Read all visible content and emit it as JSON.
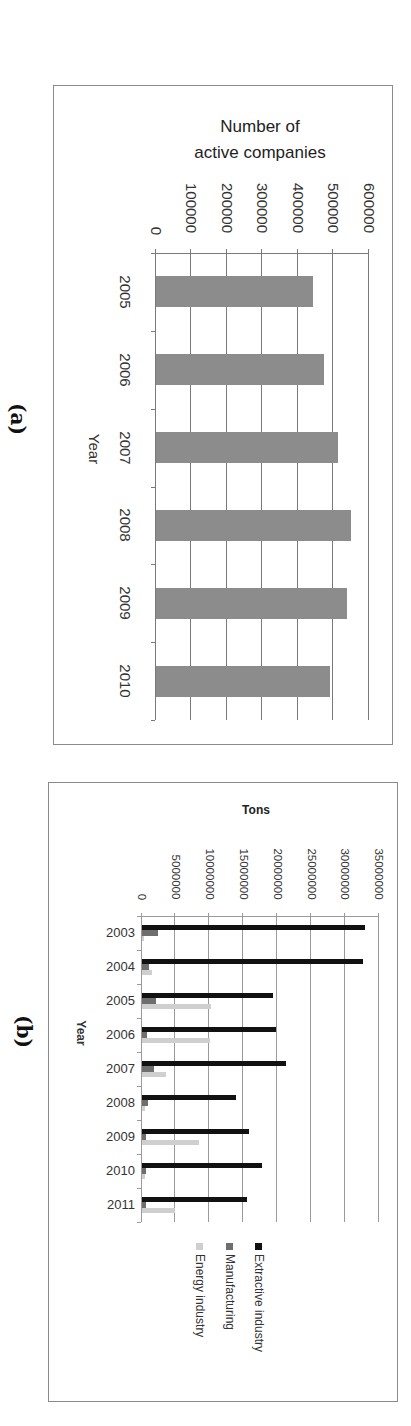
{
  "figure": {
    "panel_a_label": "(a)",
    "panel_b_label": "(b)"
  },
  "chart_data": [
    {
      "type": "bar",
      "orientation": "horizontal (figure rotated 90° clockwise)",
      "title": "Number of active companies",
      "title_lines": [
        "Number of",
        "active companies"
      ],
      "xlabel": "Year",
      "ylabel": "Number of active companies",
      "categories": [
        "2005",
        "2006",
        "2007",
        "2008",
        "2009",
        "2010"
      ],
      "values": [
        443000,
        473000,
        514000,
        550000,
        538000,
        491000
      ],
      "value_ticks": [
        "0",
        "100000",
        "200000",
        "300000",
        "400000",
        "500000",
        "600000"
      ],
      "ylim": [
        0,
        600000
      ],
      "grid": true,
      "bar_color": "#8c8c8c",
      "legend": null
    },
    {
      "type": "bar",
      "orientation": "horizontal (figure rotated 90° clockwise)",
      "title": "",
      "xlabel": "Year",
      "ylabel": "Tons",
      "categories": [
        "2003",
        "2004",
        "2005",
        "2006",
        "2007",
        "2008",
        "2009",
        "2010",
        "2011"
      ],
      "series": [
        {
          "name": "Extractive industry",
          "color": "#111111",
          "values": [
            33000000,
            32600000,
            19400000,
            19900000,
            21300000,
            13900000,
            15900000,
            17700000,
            15500000
          ]
        },
        {
          "name": "Manufacturing",
          "color": "#6e6e6e",
          "values": [
            2500000,
            1100000,
            2100000,
            800000,
            1900000,
            1000000,
            700000,
            700000,
            700000
          ]
        },
        {
          "name": "Energy industry",
          "color": "#cfcfcf",
          "values": [
            300000,
            1500000,
            10300000,
            10100000,
            3600000,
            500000,
            8500000,
            500000,
            4900000
          ]
        }
      ],
      "value_ticks": [
        "0",
        "5000000",
        "10000000",
        "15000000",
        "20000000",
        "25000000",
        "30000000",
        "35000000"
      ],
      "ylim": [
        0,
        35000000
      ],
      "grid": true,
      "legend_position": "bottom (right side in rotated view)"
    }
  ]
}
